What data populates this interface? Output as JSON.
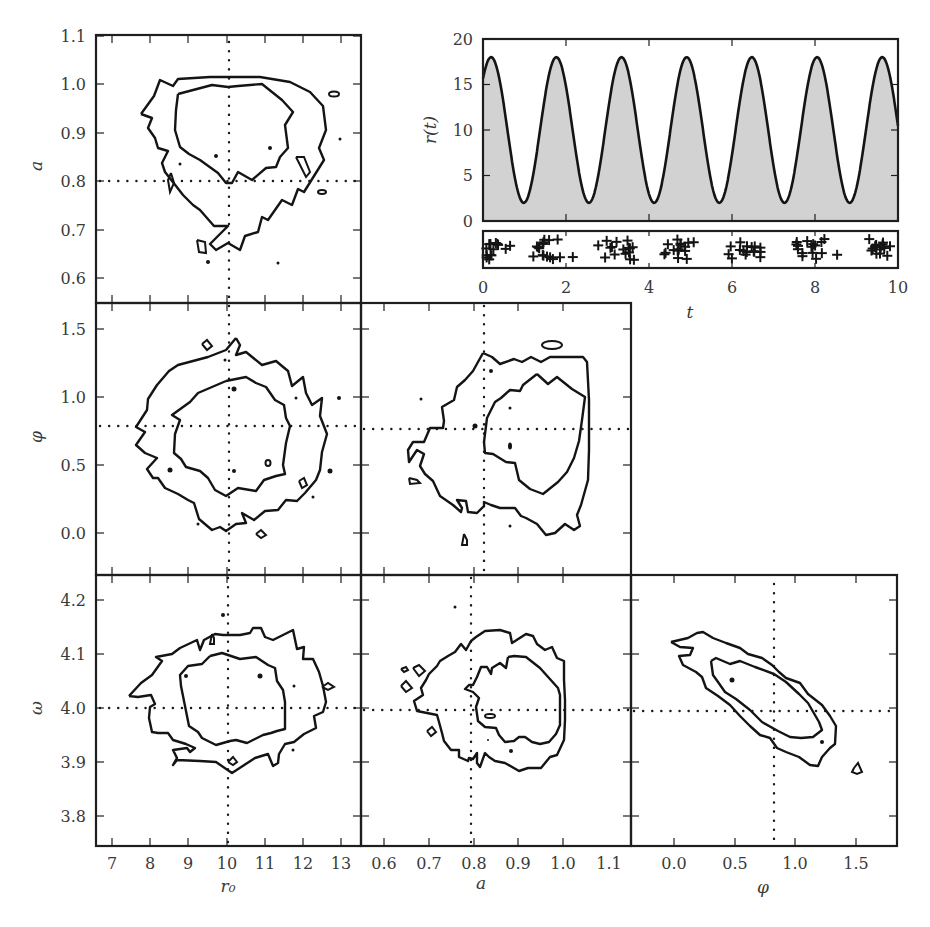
{
  "figure": {
    "width": 930,
    "height": 927,
    "colors": {
      "line": "#141414",
      "fill": "#d2d2d2",
      "text": "#3a3a3a",
      "background": "#ffffff"
    }
  },
  "chart_data": [
    {
      "id": "timeseries",
      "type": "area",
      "title": "",
      "xlabel": "t",
      "ylabel": "r(t)",
      "xlim": [
        0,
        10
      ],
      "ylim": [
        0,
        20
      ],
      "xticks": [
        0,
        2,
        4,
        6,
        8,
        10
      ],
      "yticks": [
        0,
        5,
        10,
        15,
        20
      ],
      "model": {
        "formula": "r(t) = r0 + a*r0*sin(omega*t + phi)",
        "r0": 10,
        "a": 0.8,
        "omega": 4.0,
        "phi": 0.785
      },
      "peaks_t": [
        0.2,
        1.78,
        3.35,
        4.93,
        6.5,
        8.07,
        9.64
      ],
      "peak_value": 18,
      "trough_value": 2,
      "box": {
        "x0": 483,
        "x1": 898,
        "y0": 39,
        "y1": 221
      }
    },
    {
      "id": "event-strip",
      "type": "scatter",
      "marker": "+",
      "xlim": [
        0,
        10
      ],
      "description": "Photon arrival times (jittered vertically) clustered at peaks of r(t)",
      "clusters_t": [
        0.3,
        1.6,
        3.3,
        4.8,
        6.4,
        8.0,
        9.6
      ],
      "box": {
        "x0": 483,
        "x1": 898,
        "y0": 231,
        "y1": 268
      }
    },
    {
      "id": "a-vs-r0",
      "type": "contour",
      "xlabel": "",
      "ylabel": "a",
      "xlim": [
        6.5,
        13.5
      ],
      "ylim": [
        0.55,
        1.1
      ],
      "yticks": [
        0.6,
        0.7,
        0.8,
        0.9,
        1.0,
        1.1
      ],
      "truth": {
        "x": 10,
        "y": 0.8
      },
      "levels": [
        "68%",
        "95%"
      ]
    },
    {
      "id": "phi-vs-r0",
      "type": "contour",
      "ylabel": "φ",
      "xlim": [
        6.5,
        13.5
      ],
      "ylim": [
        -0.3,
        1.7
      ],
      "yticks": [
        0.0,
        0.5,
        1.0,
        1.5
      ],
      "truth": {
        "x": 10,
        "y": 0.785
      },
      "levels": [
        "68%",
        "95%"
      ]
    },
    {
      "id": "phi-vs-a",
      "type": "contour",
      "xlim": [
        0.55,
        1.1
      ],
      "ylim": [
        -0.3,
        1.7
      ],
      "truth": {
        "x": 0.8,
        "y": 0.785
      },
      "levels": [
        "68%",
        "95%"
      ]
    },
    {
      "id": "omega-vs-r0",
      "type": "contour",
      "xlabel": "r₀",
      "ylabel": "ω",
      "xlim": [
        6.5,
        13.5
      ],
      "ylim": [
        3.75,
        4.25
      ],
      "xticks": [
        7,
        8,
        9,
        10,
        11,
        12,
        13
      ],
      "yticks": [
        3.8,
        3.9,
        4.0,
        4.1,
        4.2
      ],
      "truth": {
        "x": 10,
        "y": 4.0
      },
      "levels": [
        "68%",
        "95%"
      ]
    },
    {
      "id": "omega-vs-a",
      "type": "contour",
      "xlabel": "a",
      "xlim": [
        0.55,
        1.1
      ],
      "ylim": [
        3.75,
        4.25
      ],
      "xticks": [
        0.6,
        0.7,
        0.8,
        0.9,
        1.0,
        1.1
      ],
      "truth": {
        "x": 0.8,
        "y": 4.0
      },
      "levels": [
        "68%",
        "95%"
      ]
    },
    {
      "id": "omega-vs-phi",
      "type": "contour",
      "xlabel": "φ",
      "xlim": [
        -0.3,
        1.7
      ],
      "ylim": [
        3.75,
        4.25
      ],
      "xticks": [
        0.0,
        0.5,
        1.0,
        1.5
      ],
      "truth": {
        "x": 0.785,
        "y": 4.0
      },
      "levels": [
        "68%",
        "95%"
      ],
      "note": "strong negative correlation between φ and ω"
    }
  ],
  "labels": {
    "ts_ylabel": "r(t)",
    "ts_xlabel": "t",
    "a_label": "a",
    "phi_label": "φ",
    "omega_label": "ω",
    "r0_label": "r₀",
    "bottom_a_label": "a",
    "bottom_phi_label": "φ"
  },
  "ticks": {
    "ts_x": [
      "0",
      "2",
      "4",
      "6",
      "8",
      "10"
    ],
    "ts_y": [
      "20",
      "15",
      "10",
      "5",
      "0"
    ],
    "a_y": [
      "1.1",
      "1.0",
      "0.9",
      "0.8",
      "0.7",
      "0.6"
    ],
    "phi_y": [
      "1.5",
      "1.0",
      "0.5",
      "0.0"
    ],
    "omega_y": [
      "4.2",
      "4.1",
      "4.0",
      "3.9",
      "3.8"
    ],
    "r0_x": [
      "7",
      "8",
      "9",
      "10",
      "11",
      "12",
      "13"
    ],
    "a_x": [
      "0.6",
      "0.7",
      "0.8",
      "0.9",
      "1.0",
      "1.1"
    ],
    "phi_x": [
      "0.0",
      "0.5",
      "1.0",
      "1.5"
    ]
  }
}
